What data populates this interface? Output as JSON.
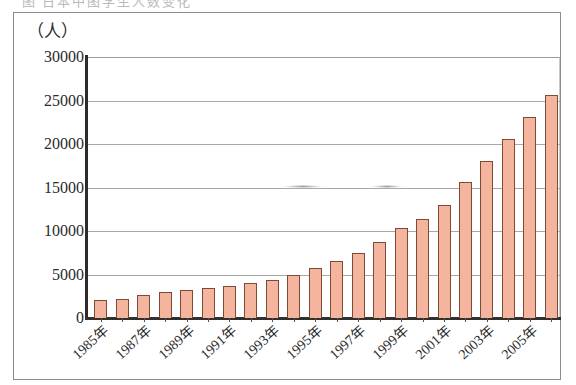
{
  "page": {
    "background_color": "#ffffff",
    "frame_color": "#8d8d8d",
    "caption_ghost": "图  日本中图学生人数变化"
  },
  "chart_data": {
    "type": "bar",
    "title": "",
    "subtitle": "",
    "xlabel": "",
    "ylabel": "（人）",
    "ylim": [
      0,
      30000
    ],
    "ytick_values": [
      0,
      5000,
      10000,
      15000,
      20000,
      25000,
      30000
    ],
    "ytick_labels": [
      "0",
      "5000",
      "10000",
      "15000",
      "20000",
      "25000",
      "30000"
    ],
    "grid": true,
    "grid_axis": "y",
    "legend": false,
    "legend_position": "none",
    "bar_fill_color": "#f4b49d",
    "bar_border_color": "#7d4a38",
    "categories": [
      "1985",
      "1986",
      "1987",
      "1988",
      "1989",
      "1990",
      "1991",
      "1992",
      "1993",
      "1994",
      "1995",
      "1996",
      "1997",
      "1998",
      "1999",
      "2000",
      "2001",
      "2002",
      "2003",
      "2004",
      "2005"
    ],
    "xtick_labels": [
      "1985年",
      "1987年",
      "1989年",
      "1991年",
      "1993年",
      "1995年",
      "1997年",
      "1999年",
      "2001年",
      "2003年",
      "2005年"
    ],
    "xtick_label_rotation": -42,
    "values": [
      2100,
      2200,
      2600,
      3000,
      3200,
      3500,
      3700,
      4000,
      4400,
      5000,
      5800,
      6500,
      7500,
      8700,
      10300,
      11400,
      13000,
      15600,
      18000,
      20600,
      23100
    ],
    "last_bar_value": 25600,
    "values_full": [
      2100,
      2200,
      2600,
      3000,
      3200,
      3500,
      3700,
      4000,
      4400,
      5000,
      5800,
      6500,
      7500,
      8700,
      10300,
      11400,
      13000,
      15600,
      18000,
      20600,
      23100,
      25600
    ]
  },
  "unit": {
    "label": "（人）"
  }
}
